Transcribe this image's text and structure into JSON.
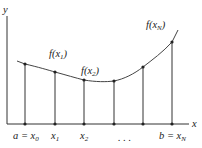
{
  "diagram": {
    "axes": {
      "x_label": "x",
      "y_label": "y"
    },
    "function_labels": [
      {
        "text_base": "f(x",
        "sub": "1",
        "close": ")"
      },
      {
        "text_base": "f(x",
        "sub": "2",
        "close": ")"
      },
      {
        "text_base": "f(x",
        "sub": "N",
        "close": ")"
      }
    ],
    "tick_labels": [
      {
        "id": "x0",
        "base": "a = x",
        "sub": "0"
      },
      {
        "id": "x1",
        "base": "x",
        "sub": "1"
      },
      {
        "id": "x2",
        "base": "x",
        "sub": "2"
      },
      {
        "id": "dots",
        "base": ". . .",
        "sub": ""
      },
      {
        "id": "xN",
        "base": "b = x",
        "sub": "N"
      }
    ],
    "partition_points": [
      {
        "x": 25,
        "y": 64
      },
      {
        "x": 55,
        "y": 72
      },
      {
        "x": 84,
        "y": 80
      },
      {
        "x": 114,
        "y": 81
      },
      {
        "x": 143,
        "y": 67
      },
      {
        "x": 172,
        "y": 42
      }
    ],
    "colors": {
      "line": "#333333",
      "text": "#222222",
      "background": "#ffffff"
    }
  }
}
